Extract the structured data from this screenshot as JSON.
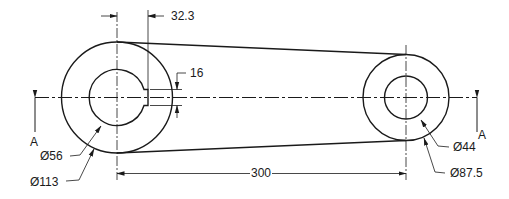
{
  "drawing": {
    "type": "mechanical-link-plan-view",
    "stroke_color": "#1a1a1a",
    "background": "#ffffff",
    "dimensions": {
      "key_offset": "32.3",
      "key_width": "16",
      "center_distance": "300",
      "left_bore": "Ø56",
      "left_boss": "Ø113",
      "right_bore": "Ø44",
      "right_boss": "Ø87.5"
    },
    "section": {
      "left_label": "A",
      "right_label": "A"
    }
  }
}
